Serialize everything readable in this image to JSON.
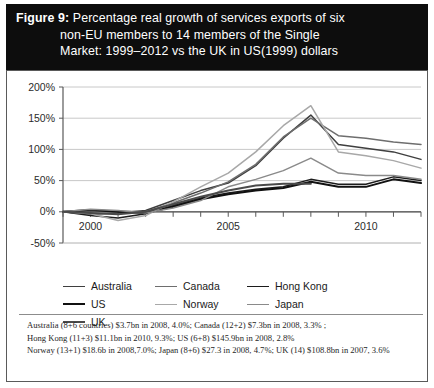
{
  "figure": {
    "label": "Figure 9:",
    "title_lines": [
      "Percentage real growth of services exports of six",
      "non-EU members to 14 members of the Single",
      "Market: 1999–2012 vs the UK in US(1999) dollars"
    ]
  },
  "footnote": {
    "lines": [
      "Australia (8+6 countries) $3.7bn in 2008, 4.0%; Canada (12+2) $7.3bn in 2008, 3.3% ;",
      "Hong Kong (11+3) $11.1bn in 2010, 9.3%; US (6+8) $145.9bn in 2008, 2.8%",
      "Norway (13+1) $18.6b in 2008,7.0%; Japan (8+6) $27.3 in 2008, 4.7%; UK (14) $108.8bn in 2007, 3.6%"
    ]
  },
  "colors": {
    "title_band": "#0d0d0d",
    "title_text": "#ffffff",
    "axis": "#595959",
    "grid": "#c2c2c2",
    "card_border": "#5a5a5a"
  },
  "chart_data": {
    "type": "line",
    "title": "Percentage real growth of services exports of six non-EU members to 14 members of the Single Market: 1999–2012 vs the UK in US(1999) dollars",
    "xlabel": "",
    "ylabel": "",
    "xlim": [
      1999,
      2012
    ],
    "ylim": [
      -50,
      200
    ],
    "yticks": [
      -50,
      0,
      50,
      100,
      150,
      200
    ],
    "ytick_labels": [
      "-50%",
      "0%",
      "50%",
      "100%",
      "150%",
      "200%"
    ],
    "x": [
      1999,
      2000,
      2001,
      2002,
      2003,
      2004,
      2005,
      2006,
      2007,
      2008,
      2009,
      2010,
      2011,
      2012
    ],
    "xticks": [
      1999,
      2000,
      2001,
      2002,
      2003,
      2004,
      2005,
      2006,
      2007,
      2008,
      2009,
      2010,
      2011,
      2012
    ],
    "xtick_labels_shown": [
      "2000",
      "2005",
      "2010"
    ],
    "grid": "horizontal",
    "legend_position": "below-plot",
    "series": [
      {
        "name": "Australia",
        "color": "#3f3f3f",
        "width": 1.5,
        "values": [
          0,
          -4,
          -2,
          2,
          18,
          34,
          46,
          74,
          118,
          155,
          108,
          102,
          96,
          84
        ]
      },
      {
        "name": "Canada",
        "color": "#6e6e6e",
        "width": 1.5,
        "values": [
          0,
          2,
          1,
          0,
          14,
          30,
          48,
          76,
          120,
          150,
          122,
          118,
          112,
          108
        ]
      },
      {
        "name": "Hong Kong",
        "color": "#1c1c1c",
        "width": 1.5,
        "values": [
          0,
          -6,
          -10,
          -3,
          10,
          22,
          30,
          36,
          40,
          52,
          44,
          44,
          56,
          50
        ]
      },
      {
        "name": "US",
        "color": "#111111",
        "width": 2,
        "values": [
          0,
          3,
          0,
          -2,
          8,
          20,
          28,
          34,
          38,
          48,
          40,
          40,
          52,
          46
        ]
      },
      {
        "name": "Norway",
        "color": "#a8a8a8",
        "width": 1.5,
        "values": [
          0,
          -3,
          -14,
          -6,
          16,
          40,
          62,
          96,
          138,
          170,
          96,
          90,
          82,
          70
        ]
      },
      {
        "name": "Japan",
        "color": "#8a8a8a",
        "width": 1.5,
        "values": [
          0,
          4,
          2,
          -2,
          6,
          18,
          40,
          52,
          66,
          86,
          62,
          58,
          58,
          52
        ]
      },
      {
        "name": "UK",
        "color": "#4a4a4a",
        "width": 2,
        "values": [
          0,
          -2,
          -4,
          0,
          12,
          24,
          34,
          42,
          45,
          45,
          null,
          null,
          null,
          null
        ]
      }
    ]
  }
}
